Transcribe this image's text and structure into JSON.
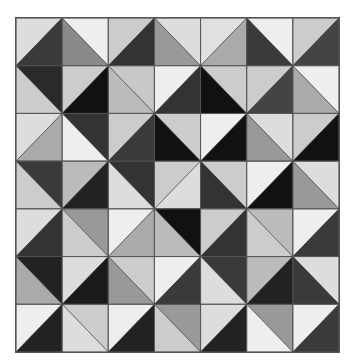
{
  "puzzle": {
    "rows": 7,
    "cols": 7,
    "grid_line_color": "#555555",
    "cells": [
      [
        {
          "diag": "/",
          "a": "#dddddd",
          "b": "#3a3a3a"
        },
        {
          "diag": "\\",
          "a": "#eeeeee",
          "b": "#8a8a8a"
        },
        {
          "diag": "/",
          "a": "#cccccc",
          "b": "#333333"
        },
        {
          "diag": "\\",
          "a": "#dddddd",
          "b": "#999999"
        },
        {
          "diag": "/",
          "a": "#e0e0e0",
          "b": "#aaaaaa"
        },
        {
          "diag": "\\",
          "a": "#eeeeee",
          "b": "#3a3a3a"
        },
        {
          "diag": "/",
          "a": "#cccccc",
          "b": "#444444"
        }
      ],
      [
        {
          "diag": "\\",
          "a": "#2a2a2a",
          "b": "#cccccc"
        },
        {
          "diag": "/",
          "a": "#cccccc",
          "b": "#111111"
        },
        {
          "diag": "\\",
          "a": "#c8c8c8",
          "b": "#bbbbbb"
        },
        {
          "diag": "/",
          "a": "#eeeeee",
          "b": "#333333"
        },
        {
          "diag": "\\",
          "a": "#cccccc",
          "b": "#111111"
        },
        {
          "diag": "/",
          "a": "#cccccc",
          "b": "#444444"
        },
        {
          "diag": "\\",
          "a": "#eeeeee",
          "b": "#aaaaaa"
        }
      ],
      [
        {
          "diag": "/",
          "a": "#dddddd",
          "b": "#aaaaaa"
        },
        {
          "diag": "\\",
          "a": "#333333",
          "b": "#eeeeee"
        },
        {
          "diag": "/",
          "a": "#cccccc",
          "b": "#3a3a3a"
        },
        {
          "diag": "\\",
          "a": "#cccccc",
          "b": "#111111"
        },
        {
          "diag": "/",
          "a": "#eeeeee",
          "b": "#111111"
        },
        {
          "diag": "\\",
          "a": "#dddddd",
          "b": "#999999"
        },
        {
          "diag": "/",
          "a": "#cccccc",
          "b": "#111111"
        }
      ],
      [
        {
          "diag": "\\",
          "a": "#3a3a3a",
          "b": "#cccccc"
        },
        {
          "diag": "/",
          "a": "#bbbbbb",
          "b": "#222222"
        },
        {
          "diag": "\\",
          "a": "#333333",
          "b": "#dddddd"
        },
        {
          "diag": "/",
          "a": "#cccccc",
          "b": "#dddddd"
        },
        {
          "diag": "\\",
          "a": "#cccccc",
          "b": "#333333"
        },
        {
          "diag": "/",
          "a": "#eeeeee",
          "b": "#111111"
        },
        {
          "diag": "\\",
          "a": "#dddddd",
          "b": "#999999"
        }
      ],
      [
        {
          "diag": "/",
          "a": "#dddddd",
          "b": "#333333"
        },
        {
          "diag": "\\",
          "a": "#999999",
          "b": "#cccccc"
        },
        {
          "diag": "/",
          "a": "#eeeeee",
          "b": "#aaaaaa"
        },
        {
          "diag": "\\",
          "a": "#111111",
          "b": "#bbbbbb"
        },
        {
          "diag": "/",
          "a": "#cccccc",
          "b": "#333333"
        },
        {
          "diag": "\\",
          "a": "#bbbbbb",
          "b": "#cccccc"
        },
        {
          "diag": "/",
          "a": "#eeeeee",
          "b": "#3a3a3a"
        }
      ],
      [
        {
          "diag": "\\",
          "a": "#222222",
          "b": "#aaaaaa"
        },
        {
          "diag": "/",
          "a": "#dddddd",
          "b": "#1a1a1a"
        },
        {
          "diag": "\\",
          "a": "#cccccc",
          "b": "#999999"
        },
        {
          "diag": "/",
          "a": "#eeeeee",
          "b": "#3a3a3a"
        },
        {
          "diag": "\\",
          "a": "#3a3a3a",
          "b": "#dddddd"
        },
        {
          "diag": "/",
          "a": "#bbbbbb",
          "b": "#222222"
        },
        {
          "diag": "\\",
          "a": "#dddddd",
          "b": "#3a3a3a"
        }
      ],
      [
        {
          "diag": "/",
          "a": "#eeeeee",
          "b": "#222222"
        },
        {
          "diag": "\\",
          "a": "#cccccc",
          "b": "#dddddd"
        },
        {
          "diag": "/",
          "a": "#eeeeee",
          "b": "#222222"
        },
        {
          "diag": "\\",
          "a": "#999999",
          "b": "#cccccc"
        },
        {
          "diag": "/",
          "a": "#dddddd",
          "b": "#222222"
        },
        {
          "diag": "\\",
          "a": "#999999",
          "b": "#eeeeee"
        },
        {
          "diag": "/",
          "a": "#eeeeee",
          "b": "#3a3a3a"
        }
      ]
    ]
  }
}
